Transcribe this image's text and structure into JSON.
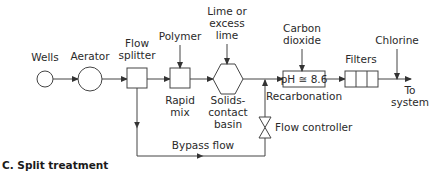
{
  "diagram": {
    "caption": "C. Split treatment",
    "nodes": {
      "wells": {
        "label": "Wells",
        "shape": "circle"
      },
      "aerator": {
        "label": "Aerator",
        "shape": "circle"
      },
      "flow_splitter": {
        "label_line1": "Flow",
        "label_line2": "splitter",
        "shape": "square"
      },
      "rapid_mix": {
        "label_line1": "Rapid",
        "label_line2": "mix",
        "shape": "square"
      },
      "solids_contact_basin": {
        "label_line1": "Solids-",
        "label_line2": "contact",
        "label_line3": "basin",
        "shape": "hexagon"
      },
      "recarbonation": {
        "box_text": "pH ≅ 8.6",
        "label": "Recarbonation",
        "shape": "rectangle"
      },
      "filters": {
        "label": "Filters",
        "shape": "three-cell-rectangle"
      },
      "to_system": {
        "label_line1": "To",
        "label_line2": "system"
      },
      "flow_controller": {
        "label": "Flow controller",
        "shape": "valve"
      }
    },
    "inputs": {
      "polymer": {
        "label": "Polymer"
      },
      "lime": {
        "label_line1": "Lime or",
        "label_line2": "excess",
        "label_line3": "lime"
      },
      "carbon_dioxide": {
        "label_line1": "Carbon",
        "label_line2": "dioxide"
      },
      "chlorine": {
        "label": "Chlorine"
      }
    },
    "bypass": {
      "label": "Bypass flow"
    }
  }
}
